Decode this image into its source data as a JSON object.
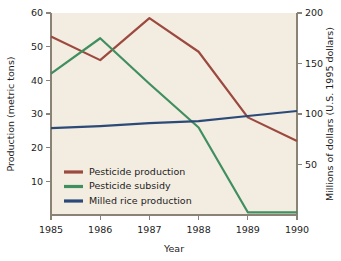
{
  "chart_data": {
    "type": "line",
    "title": "",
    "xlabel": "Year",
    "ylabel": "Production (metric tons)",
    "y2label": "Millions of dollars (U.S. 1995 dollars)",
    "categories": [
      "1985",
      "1986",
      "1987",
      "1988",
      "1989",
      "1990"
    ],
    "x": [
      1985,
      1986,
      1987,
      1988,
      1989,
      1990
    ],
    "xlim": [
      1985,
      1990
    ],
    "ylim": [
      0,
      60
    ],
    "y2lim": [
      0,
      200
    ],
    "yticks": [
      10,
      20,
      30,
      40,
      50,
      60
    ],
    "y2ticks": [
      50,
      100,
      150,
      200
    ],
    "grid": false,
    "legend_position": "lower-left-inside",
    "plot_background": "#f3ece1",
    "series": [
      {
        "name": "Pesticide production",
        "axis": "left",
        "color": "#9c4a3f",
        "values": [
          53,
          46,
          58.5,
          48.5,
          29,
          22
        ]
      },
      {
        "name": "Pesticide subsidy",
        "axis": "left",
        "color": "#3f8f5f",
        "values": [
          42,
          52.5,
          39,
          26,
          0.8,
          0.8
        ]
      },
      {
        "name": "Milled rice production",
        "axis": "right",
        "color": "#2b4a78",
        "values": [
          86,
          88,
          91,
          93,
          98,
          103
        ]
      }
    ]
  },
  "axes": {
    "left_title": "Production (metric tons)",
    "right_title": "Millions of dollars (U.S. 1995 dollars)",
    "bottom_title": "Year",
    "left_ticks": [
      "10",
      "20",
      "30",
      "40",
      "50",
      "60"
    ],
    "right_ticks": [
      "50",
      "100",
      "150",
      "200"
    ],
    "bottom_ticks": [
      "1985",
      "1986",
      "1987",
      "1988",
      "1989",
      "1990"
    ]
  },
  "legend": {
    "items": [
      {
        "label": "Pesticide production",
        "color": "#9c4a3f"
      },
      {
        "label": "Pesticide subsidy",
        "color": "#3f8f5f"
      },
      {
        "label": "Milled rice production",
        "color": "#2b4a78"
      }
    ]
  }
}
